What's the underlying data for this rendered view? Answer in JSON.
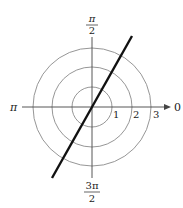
{
  "diagram": {
    "type": "polar-graph",
    "angle_labels": {
      "right": "0",
      "top_numerator": "π",
      "top_denominator": "2",
      "left": "π",
      "bottom_numerator": "3π",
      "bottom_denominator": "2"
    },
    "radius_labels": [
      "1",
      "2",
      "3"
    ],
    "circle_radii": [
      1,
      2,
      3
    ],
    "curve": {
      "description": "straight line through the pole",
      "color": "#111111"
    },
    "colors": {
      "grid": "#8a8a8a",
      "axis": "#444444",
      "curve": "#111111"
    }
  }
}
